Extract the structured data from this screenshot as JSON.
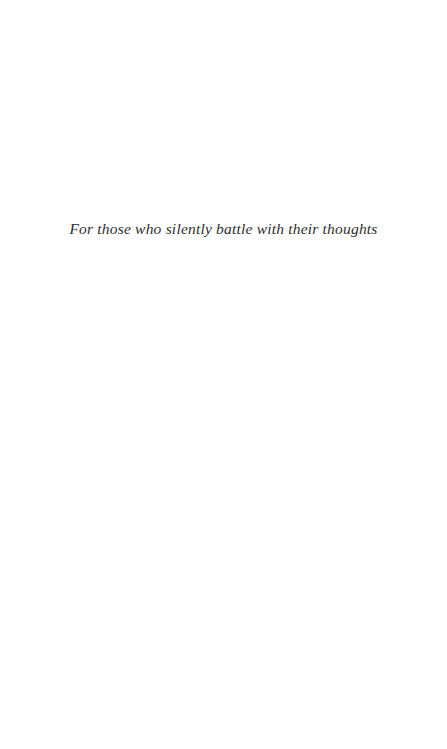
{
  "page": {
    "type": "book-dedication-page",
    "dedication_text": "For those who silently battle with their thoughts"
  },
  "colors": {
    "background": "#ffffff",
    "text": "#2e2e2e"
  }
}
